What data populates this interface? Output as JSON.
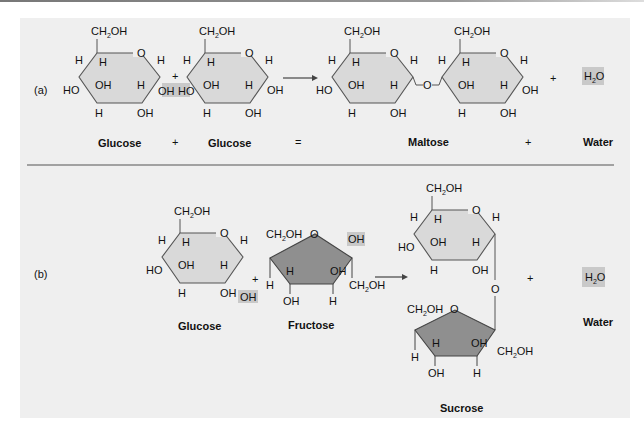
{
  "figure": {
    "panel_a": {
      "label": "(a)",
      "reactants": [
        "Glucose",
        "Glucose"
      ],
      "product": "Maltose",
      "byproduct": "Water",
      "byproduct_formula": "H2O",
      "equation_symbols": {
        "plus1": "+",
        "equals": "=",
        "plus2": "+"
      },
      "reaction": "Glucose + Glucose = Maltose + Water"
    },
    "panel_b": {
      "label": "(b)",
      "reactants": [
        "Glucose",
        "Fructose"
      ],
      "product": "Sucrose",
      "byproduct": "Water",
      "byproduct_formula": "H2O",
      "reaction": "Glucose + Fructose → Sucrose + Water"
    },
    "groups": {
      "ch2oh": "CH2OH",
      "oh": "OH",
      "ho": "HO",
      "h": "H",
      "o": "O",
      "plus": "+"
    },
    "colors": {
      "panel_bg": "#efefef",
      "hexose_fill": "#d9d9d9",
      "furanose_fill": "#8f8f8f",
      "highlight": "#c9c9c9",
      "line": "#444444"
    }
  }
}
